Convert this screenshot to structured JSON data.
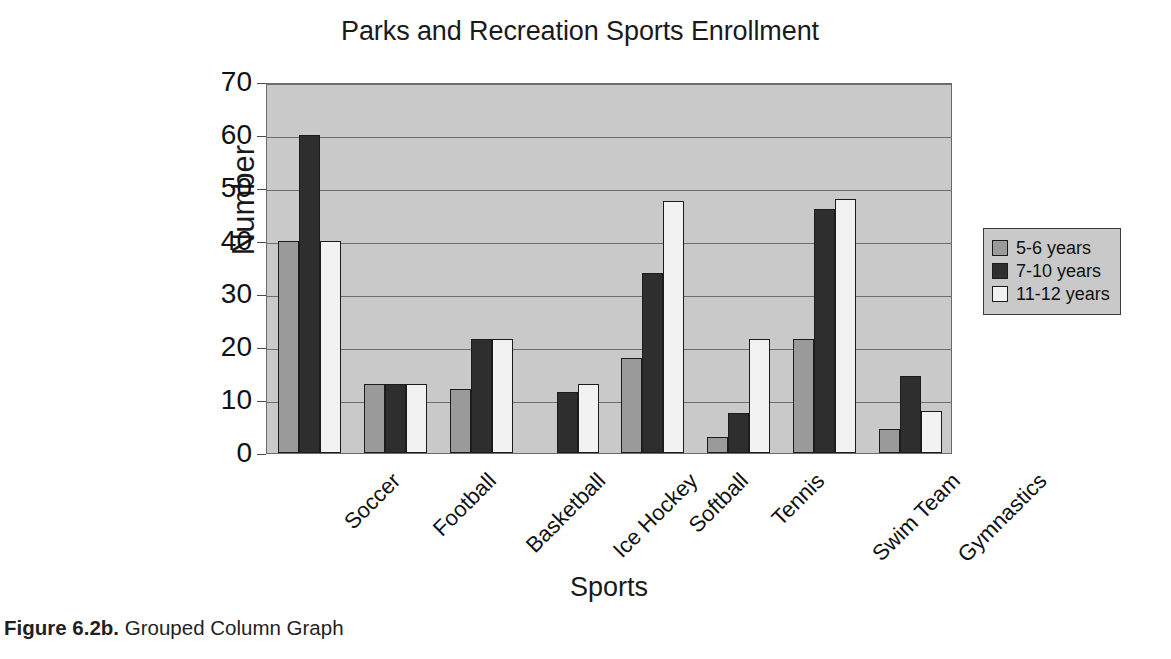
{
  "figure": {
    "caption_label": "Figure 6.2b.",
    "caption_text": " Grouped Column Graph"
  },
  "legend": {
    "position": "right",
    "items": [
      {
        "label": "5-6 years",
        "color": "#9a9a9a"
      },
      {
        "label": "7-10 years",
        "color": "#2e2e2e"
      },
      {
        "label": "11-12 years",
        "color": "#f2f2f2"
      }
    ]
  },
  "chart_data": {
    "type": "bar",
    "title": "Parks and Recreation Sports Enrollment",
    "xlabel": "Sports",
    "ylabel": "Number",
    "ylim": [
      0,
      70
    ],
    "ytick_step": 10,
    "yticks": [
      70,
      60,
      50,
      40,
      30,
      20,
      10,
      0
    ],
    "ytick_labels": [
      "70",
      "60",
      "50",
      "40",
      "30",
      "20",
      "10",
      "0"
    ],
    "grid": true,
    "grid_axis": "y",
    "legend_position": "right",
    "categories": [
      "Soccer",
      "Football",
      "Basketball",
      "Ice Hockey",
      "Softball",
      "Tennis",
      "Swim Team",
      "Gymnastics"
    ],
    "series": [
      {
        "name": "5-6 years",
        "color": "#9a9a9a",
        "values": [
          40,
          13,
          12,
          0,
          18,
          3,
          21.5,
          4.5
        ]
      },
      {
        "name": "7-10 years",
        "color": "#2e2e2e",
        "values": [
          60,
          13,
          21.5,
          11.5,
          34,
          7.5,
          46,
          14.5
        ]
      },
      {
        "name": "11-12 years",
        "color": "#f2f2f2",
        "values": [
          40,
          13,
          21.5,
          13,
          47.5,
          21.5,
          48,
          8
        ]
      }
    ],
    "plot_background": "#c9c9c9",
    "bar_edge_color": "#1c1c1c"
  }
}
